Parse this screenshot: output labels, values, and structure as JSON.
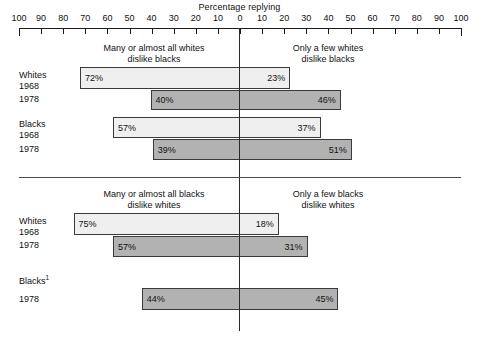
{
  "chart_data": {
    "type": "bar",
    "title": "Percentage replying",
    "xlabel": "Percentage replying",
    "ylabel": "",
    "orientation": "horizontal-diverging",
    "grid": false,
    "legend_position": "none",
    "axis": {
      "left_ticks": [
        100,
        90,
        80,
        70,
        60,
        50,
        40,
        30,
        20,
        10
      ],
      "center_tick": 0,
      "right_ticks": [
        10,
        20,
        30,
        40,
        50,
        60,
        70,
        80,
        90,
        100
      ],
      "all_tick_labels": [
        "100",
        "90",
        "80",
        "70",
        "60",
        "50",
        "40",
        "30",
        "20",
        "10",
        "0",
        "10",
        "20",
        "30",
        "40",
        "50",
        "60",
        "70",
        "80",
        "90",
        "100"
      ],
      "xlim_left": [
        100,
        0
      ],
      "xlim_right": [
        0,
        100
      ]
    },
    "colors": {
      "series_1968_fill": "#efefef",
      "series_1978_fill": "#b2b2b2",
      "bar_border": "#3a3a3a",
      "axis": "#1b1b1b",
      "zero_line": "#2a2a2a",
      "rule": "#4a4a4a",
      "text": "#111111"
    },
    "panels": [
      {
        "id": "whites-dislike-blacks",
        "left_header": "Many or almost all whites\ndislike blacks",
        "left_header_line1": "Many or almost all whites",
        "left_header_line2": "dislike blacks",
        "right_header": "Only a few whites\ndislike blacks",
        "right_header_line1": "Only a few whites",
        "right_header_line2": "dislike blacks",
        "groups": [
          {
            "group_label": "Whites",
            "rows": [
              {
                "year": "1968",
                "series": "1968",
                "left_value": 72,
                "right_value": 23,
                "left_label": "72%",
                "right_label": "23%"
              },
              {
                "year": "1978",
                "series": "1978",
                "left_value": 40,
                "right_value": 46,
                "left_label": "40%",
                "right_label": "46%"
              }
            ]
          },
          {
            "group_label": "Blacks",
            "rows": [
              {
                "year": "1968",
                "series": "1968",
                "left_value": 57,
                "right_value": 37,
                "left_label": "57%",
                "right_label": "37%"
              },
              {
                "year": "1978",
                "series": "1978",
                "left_value": 39,
                "right_value": 51,
                "left_label": "39%",
                "right_label": "51%"
              }
            ]
          }
        ]
      },
      {
        "id": "blacks-dislike-whites",
        "left_header": "Many or almost all blacks\ndislike whites",
        "left_header_line1": "Many or almost all blacks",
        "left_header_line2": "dislike whites",
        "right_header": "Only a few blacks\ndislike whites",
        "right_header_line1": "Only a few blacks",
        "right_header_line2": "dislike whites",
        "groups": [
          {
            "group_label": "Whites",
            "rows": [
              {
                "year": "1968",
                "series": "1968",
                "left_value": 75,
                "right_value": 18,
                "left_label": "75%",
                "right_label": "18%"
              },
              {
                "year": "1978",
                "series": "1978",
                "left_value": 57,
                "right_value": 31,
                "left_label": "57%",
                "right_label": "31%"
              }
            ]
          },
          {
            "group_label": "Blacks",
            "group_label_footnote": "1",
            "rows": [
              {
                "year": "1978",
                "series": "1978",
                "left_value": 44,
                "right_value": 45,
                "left_label": "44%",
                "right_label": "45%"
              }
            ]
          }
        ]
      }
    ]
  },
  "axis": {
    "title": "Percentage replying",
    "labels": [
      "100",
      "90",
      "80",
      "70",
      "60",
      "50",
      "40",
      "30",
      "20",
      "10",
      "0",
      "10",
      "20",
      "30",
      "40",
      "50",
      "60",
      "70",
      "80",
      "90",
      "100"
    ]
  },
  "panel1": {
    "left_header_line1": "Many or almost all whites",
    "left_header_line2": "dislike blacks",
    "right_header_line1": "Only a few whites",
    "right_header_line2": "dislike blacks",
    "group1_label": "Whites",
    "group1_row1_year": "1968",
    "group1_row1_left": "72%",
    "group1_row1_right": "23%",
    "group1_row2_year": "1978",
    "group1_row2_left": "40%",
    "group1_row2_right": "46%",
    "group2_label": "Blacks",
    "group2_row1_year": "1968",
    "group2_row1_left": "57%",
    "group2_row1_right": "37%",
    "group2_row2_year": "1978",
    "group2_row2_left": "39%",
    "group2_row2_right": "51%"
  },
  "panel2": {
    "left_header_line1": "Many or almost all blacks",
    "left_header_line2": "dislike whites",
    "right_header_line1": "Only a few blacks",
    "right_header_line2": "dislike whites",
    "group1_label": "Whites",
    "group1_row1_year": "1968",
    "group1_row1_left": "75%",
    "group1_row1_right": "18%",
    "group1_row2_year": "1978",
    "group1_row2_left": "57%",
    "group1_row2_right": "31%",
    "group2_label": "Blacks",
    "group2_footnote": "1",
    "group2_row1_year": "1978",
    "group2_row1_left": "44%",
    "group2_row1_right": "45%"
  }
}
